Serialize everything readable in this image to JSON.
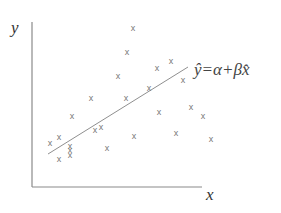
{
  "diagram": {
    "y_axis_label": "y",
    "x_axis_label": "x",
    "equation": "ŷ=α+βx̂",
    "colors": {
      "axis": "#888888",
      "marker": "#777777",
      "line": "#888888",
      "text": "#333333"
    },
    "axes": {
      "origin": [
        32,
        187
      ],
      "y_top": 22,
      "x_right": 202
    },
    "regression_line": {
      "from": [
        48,
        154
      ],
      "to": [
        188,
        67
      ]
    },
    "marker_symbol": "x",
    "points": [
      [
        133,
        28
      ],
      [
        127,
        52
      ],
      [
        118,
        76
      ],
      [
        157,
        68
      ],
      [
        171,
        61
      ],
      [
        183,
        80
      ],
      [
        149,
        88
      ],
      [
        126,
        98
      ],
      [
        91,
        98
      ],
      [
        72,
        116
      ],
      [
        50,
        143
      ],
      [
        59,
        137
      ],
      [
        70,
        146
      ],
      [
        70,
        150
      ],
      [
        70,
        155
      ],
      [
        59,
        159
      ],
      [
        95,
        130
      ],
      [
        101,
        127
      ],
      [
        107,
        148
      ],
      [
        159,
        112
      ],
      [
        191,
        107
      ],
      [
        203,
        116
      ],
      [
        176,
        133
      ],
      [
        211,
        139
      ],
      [
        134,
        136
      ]
    ]
  }
}
